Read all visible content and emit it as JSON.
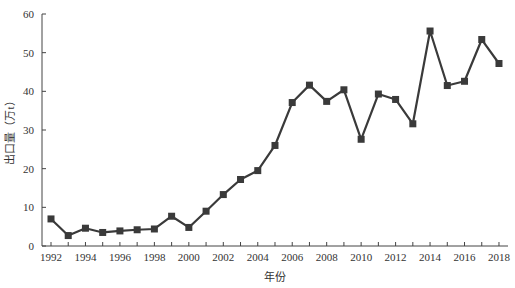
{
  "chart_data": {
    "type": "line",
    "title": "",
    "xlabel": "年份",
    "ylabel": "出口量（万t）",
    "ylim": [
      0,
      60
    ],
    "yticks": [
      0,
      10,
      20,
      30,
      40,
      50,
      60
    ],
    "xticks": [
      1992,
      1994,
      1996,
      1998,
      2000,
      2002,
      2004,
      2006,
      2008,
      2010,
      2012,
      2014,
      2016,
      2018
    ],
    "grid": false,
    "legend": null,
    "x": [
      1992,
      1993,
      1994,
      1995,
      1996,
      1997,
      1998,
      1999,
      2000,
      2001,
      2002,
      2003,
      2004,
      2005,
      2006,
      2007,
      2008,
      2009,
      2010,
      2011,
      2012,
      2013,
      2014,
      2015,
      2016,
      2017,
      2018
    ],
    "series": [
      {
        "name": "出口量",
        "marker": "square",
        "color": "#3a3a3a",
        "values": [
          7.0,
          2.7,
          4.6,
          3.5,
          3.9,
          4.2,
          4.4,
          7.7,
          4.8,
          9.0,
          13.3,
          17.2,
          19.5,
          26.0,
          37.1,
          41.6,
          37.4,
          40.4,
          27.6,
          39.3,
          37.9,
          31.6,
          55.6,
          41.5,
          42.6,
          53.4,
          47.2
        ]
      }
    ]
  }
}
